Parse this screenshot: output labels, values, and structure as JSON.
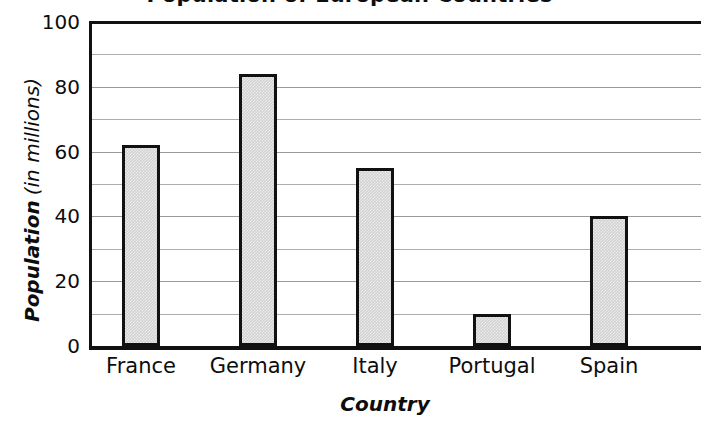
{
  "chart_data": {
    "type": "bar",
    "title": "Population of European Countries",
    "xlabel": "Country",
    "ylabel_strong": "Population",
    "ylabel_soft": "(in millions)",
    "ylabel_full": "Population (in millions)",
    "categories": [
      "France",
      "Germany",
      "Italy",
      "Portugal",
      "Spain"
    ],
    "values": [
      62,
      84,
      55,
      10,
      40
    ],
    "ylim": [
      0,
      100
    ],
    "ytick_labels": [
      "0",
      "20",
      "40",
      "60",
      "80",
      "100"
    ],
    "ytick_values": [
      0,
      20,
      40,
      60,
      80,
      100
    ],
    "minor_gridline_values": [
      10,
      30,
      50,
      70,
      90
    ],
    "grid": true,
    "legend": "none",
    "bar_fill_color": "#d2d2d2",
    "bar_border_color": "#111111",
    "axis_color": "#111111",
    "gridline_color": "#adadad",
    "background_color": "#ffffff"
  }
}
